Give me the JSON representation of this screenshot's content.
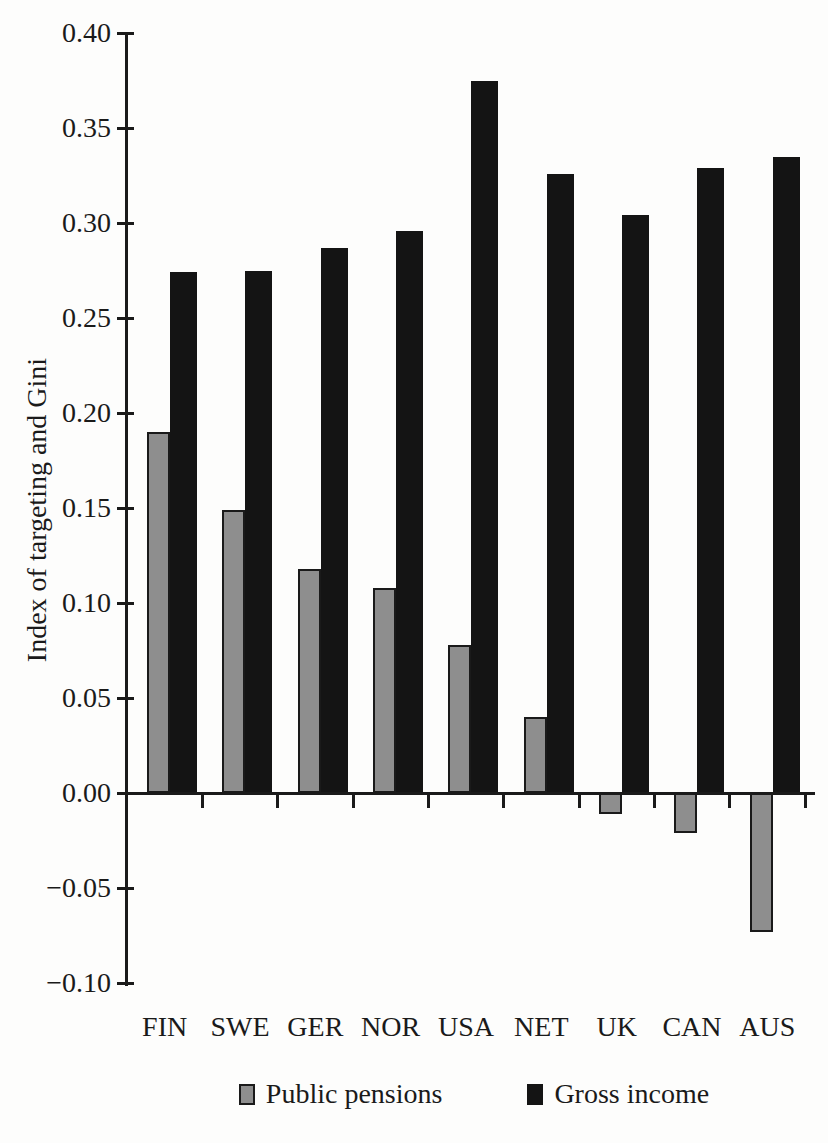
{
  "chart_data": {
    "type": "bar",
    "title": "",
    "xlabel": "",
    "ylabel": "Index of targeting and Gini",
    "categories": [
      "FIN",
      "SWE",
      "GER",
      "NOR",
      "USA",
      "NET",
      "UK",
      "CAN",
      "AUS"
    ],
    "series": [
      {
        "name": "Public pensions",
        "color": "#8e8e8e",
        "border_color": "#1a1a1a",
        "values": [
          0.19,
          0.149,
          0.118,
          0.108,
          0.078,
          0.04,
          -0.011,
          -0.021,
          -0.073
        ]
      },
      {
        "name": "Gross income",
        "color": "#141414",
        "border_color": "#141414",
        "values": [
          0.274,
          0.275,
          0.287,
          0.296,
          0.375,
          0.326,
          0.304,
          0.329,
          0.335
        ]
      }
    ],
    "ylim": [
      -0.1,
      0.4
    ],
    "yticks": [
      {
        "value": 0.4,
        "label": "0.40"
      },
      {
        "value": 0.35,
        "label": "0.35"
      },
      {
        "value": 0.3,
        "label": "0.30"
      },
      {
        "value": 0.25,
        "label": "0.25"
      },
      {
        "value": 0.2,
        "label": "0.20"
      },
      {
        "value": 0.15,
        "label": "0.15"
      },
      {
        "value": 0.1,
        "label": "0.10"
      },
      {
        "value": 0.05,
        "label": "0.05"
      },
      {
        "value": 0.0,
        "label": "0.00"
      },
      {
        "value": -0.05,
        "label": "−0.05"
      },
      {
        "value": -0.1,
        "label": "−0.10"
      }
    ],
    "grid": false,
    "legend_position": "bottom",
    "axis_color": "#1a1a1a"
  }
}
